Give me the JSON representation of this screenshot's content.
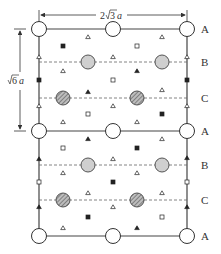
{
  "diagram": {
    "title": "",
    "dimension_horizontal": {
      "coef": "2",
      "radical": "3",
      "unit": "a"
    },
    "dimension_vertical": {
      "radical": "6",
      "unit": "a"
    },
    "layer_labels": [
      "A",
      "B",
      "C",
      "A",
      "B",
      "C",
      "A"
    ],
    "legend_symbols": {
      "big-open-circle": "A-layer atom",
      "grey-circle": "B-layer atom",
      "hatched-circle": "C-layer atom",
      "open-triangle": "site",
      "filled-triangle": "site",
      "open-square": "site",
      "filled-square": "site"
    },
    "colors": {
      "line": "#444444",
      "grey_fill": "#cfcfcf",
      "dashed_line": "#666666",
      "marker": "#222222"
    }
  }
}
